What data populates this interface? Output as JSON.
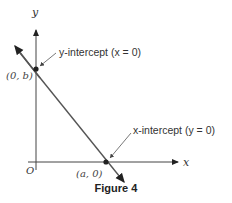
{
  "figure": {
    "caption": "Figure 4",
    "axes": {
      "x_label": "x",
      "y_label": "y",
      "origin_label": "O"
    },
    "points": {
      "y_intercept": "(0, b)",
      "x_intercept": "(a, 0)"
    },
    "annotations": {
      "y_intercept": "y-intercept (x = 0)",
      "x_intercept": "x-intercept (y = 0)"
    },
    "colors": {
      "line": "#555555",
      "axis": "#444444",
      "text": "#333333"
    }
  }
}
